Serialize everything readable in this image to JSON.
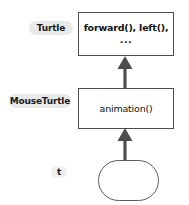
{
  "diagram": {
    "type": "class-inheritance-diagram",
    "style": "hand-drawn sketch",
    "background_color": "#ffffff",
    "stroke_color": "#4d4d4d",
    "label_pill_color": "#e9e9e9",
    "labels": {
      "turtle": "Turtle",
      "mouseturtle": "MouseTurtle",
      "instance": "t"
    },
    "nodes": [
      {
        "id": "turtle-class",
        "label": "Turtle",
        "shape": "rectangle",
        "text_line_1": "forward(), left(),",
        "text_line_2": "..."
      },
      {
        "id": "mouseturtle-class",
        "label": "MouseTurtle",
        "shape": "rectangle",
        "text_line_1": "animation()"
      },
      {
        "id": "t-instance",
        "label": "t",
        "shape": "rounded-rectangle",
        "text_line_1": ""
      }
    ],
    "arrows": [
      {
        "id": "arrow-mouseturtle-to-turtle",
        "from": "mouseturtle-class",
        "to": "turtle-class",
        "direction": "up"
      },
      {
        "id": "arrow-instance-to-mouseturtle",
        "from": "t-instance",
        "to": "mouseturtle-class",
        "direction": "up"
      }
    ]
  }
}
